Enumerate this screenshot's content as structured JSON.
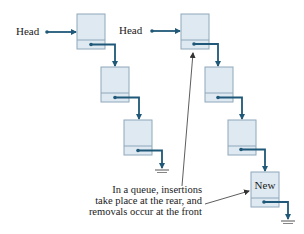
{
  "colors": {
    "node_fill": "#dfe9f1",
    "node_border": "#8ea8bb",
    "pointer": "#1f5878",
    "annotation_line": "#333333"
  },
  "left_list": {
    "head_label": "Head",
    "nodes": [
      {
        "x": 77,
        "y": 14,
        "label": ""
      },
      {
        "x": 101,
        "y": 67,
        "label": ""
      },
      {
        "x": 124,
        "y": 120,
        "label": ""
      }
    ]
  },
  "right_list": {
    "head_label": "Head",
    "nodes": [
      {
        "x": 181,
        "y": 14,
        "label": ""
      },
      {
        "x": 205,
        "y": 67,
        "label": ""
      },
      {
        "x": 228,
        "y": 120,
        "label": ""
      },
      {
        "x": 251,
        "y": 172,
        "label": "New"
      }
    ]
  },
  "caption": {
    "lines": [
      "In a queue, insertions",
      "take place at the rear, and",
      "removals occur at the front"
    ]
  }
}
